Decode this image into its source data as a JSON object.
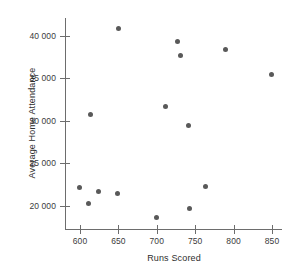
{
  "chart_data": {
    "type": "scatter",
    "title": "",
    "xlabel": "Runs Scored",
    "ylabel": "Average Home Attendance",
    "xlim": [
      585,
      865
    ],
    "ylim": [
      18000,
      41500
    ],
    "xticks": [
      600,
      650,
      700,
      750,
      800,
      850
    ],
    "xtick_labels": [
      "600",
      "650",
      "700",
      "750",
      "800",
      "850"
    ],
    "yticks": [
      20000,
      25000,
      30000,
      35000,
      40000
    ],
    "ytick_labels": [
      "20 000",
      "25 000",
      "30 000",
      "35 000",
      "40 000"
    ],
    "grid": false,
    "legend": null,
    "marker": {
      "shape": "circle",
      "color": "#595959",
      "size_px": 5
    },
    "points": [
      {
        "x": 599,
        "y": 22100
      },
      {
        "x": 611,
        "y": 20300
      },
      {
        "x": 614,
        "y": 30700
      },
      {
        "x": 624,
        "y": 21700
      },
      {
        "x": 649,
        "y": 21500
      },
      {
        "x": 650,
        "y": 40900
      },
      {
        "x": 700,
        "y": 18600
      },
      {
        "x": 711,
        "y": 31700
      },
      {
        "x": 727,
        "y": 39300
      },
      {
        "x": 731,
        "y": 37700
      },
      {
        "x": 741,
        "y": 29500
      },
      {
        "x": 743,
        "y": 19700
      },
      {
        "x": 764,
        "y": 22300
      },
      {
        "x": 790,
        "y": 38400
      },
      {
        "x": 849,
        "y": 35400
      }
    ]
  }
}
